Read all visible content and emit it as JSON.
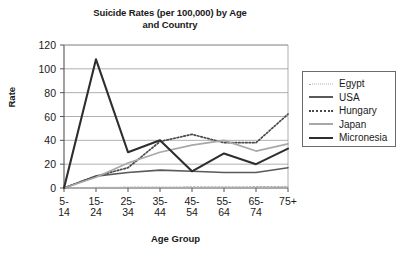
{
  "chart_data": {
    "type": "line",
    "title": "Suicide Rates (per 100,000) by Age and Country",
    "title_line1": "Suicide Rates (per 100,000) by Age",
    "title_line2": "and Country",
    "xlabel": "Age Group",
    "ylabel": "Rate",
    "ylim": [
      0,
      120
    ],
    "yticks": [
      0,
      20,
      40,
      60,
      80,
      100,
      120
    ],
    "ytick_labels": [
      "0",
      "20",
      "40",
      "60",
      "80",
      "100",
      "120"
    ],
    "grid": "horizontal",
    "legend_position": "right-outside",
    "categories": [
      "5-14",
      "15-24",
      "25-34",
      "35-44",
      "45-54",
      "55-64",
      "65-74",
      "75+"
    ],
    "category_labels_top": [
      "5-",
      "15-",
      "25-",
      "35-",
      "45-",
      "55-",
      "65-",
      "75+"
    ],
    "category_labels_bottom": [
      "14",
      "24",
      "34",
      "44",
      "54",
      "64",
      "74",
      ""
    ],
    "series": [
      {
        "name": "Egypt",
        "style": "dotted",
        "color": "#b0b0b0",
        "width": 1.4,
        "values": [
          0,
          0.4,
          0.6,
          0.7,
          0.8,
          0.9,
          1.0,
          1.2
        ]
      },
      {
        "name": "USA",
        "style": "solid",
        "color": "#5a5a5a",
        "width": 1.6,
        "values": [
          0,
          10,
          13,
          15,
          14,
          13,
          13,
          17
        ]
      },
      {
        "name": "Hungary",
        "style": "dotted",
        "color": "#4a4a4a",
        "width": 1.7,
        "values": [
          0,
          10,
          17,
          39,
          45,
          38,
          38,
          62
        ]
      },
      {
        "name": "Japan",
        "style": "solid",
        "color": "#a8a8a8",
        "width": 1.7,
        "values": [
          0,
          9,
          21,
          30,
          36,
          40,
          31,
          37
        ]
      },
      {
        "name": "Micronesia",
        "style": "solid",
        "color": "#2e2e2e",
        "width": 2.1,
        "values": [
          0,
          108,
          30,
          40,
          14,
          29,
          20,
          33
        ]
      }
    ]
  }
}
